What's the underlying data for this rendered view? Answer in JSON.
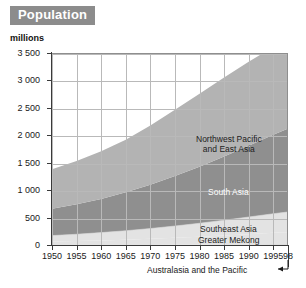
{
  "header": {
    "title": "Population",
    "title_bg": "#8c8c8c",
    "title_color": "#ffffff"
  },
  "chart_data": {
    "type": "area",
    "stacked": true,
    "title": "Population",
    "unit_label": "millions",
    "xlabel": "",
    "ylabel": "millions",
    "grid": true,
    "legend_position": "inline-annotations",
    "xlim": [
      1950,
      1998
    ],
    "ylim": [
      0,
      3500
    ],
    "x": [
      1950,
      1955,
      1960,
      1965,
      1970,
      1975,
      1980,
      1985,
      1990,
      1995,
      1998
    ],
    "x_tick_labels": [
      "1950",
      "1955",
      "1960",
      "1965",
      "1970",
      "1975",
      "1980",
      "1985",
      "1990",
      "1995",
      "98"
    ],
    "y_tick_values": [
      0,
      500,
      1000,
      1500,
      2000,
      2500,
      3000,
      3500
    ],
    "y_tick_labels": [
      "0",
      "500",
      "1 000",
      "1 500",
      "2 000",
      "2 500",
      "3 000",
      "3 500"
    ],
    "series": [
      {
        "name": "Australasia and the Pacific",
        "color": "#cfcfcf",
        "label_placement": "below-axis-annotation",
        "values": [
          12,
          14,
          16,
          18,
          20,
          22,
          24,
          26,
          28,
          30,
          31
        ]
      },
      {
        "name": "Greater Mekong",
        "color": "#e3e3e3",
        "label_placement": "inside-bottom",
        "values": [
          68,
          76,
          86,
          98,
          112,
          128,
          146,
          166,
          188,
          210,
          222
        ]
      },
      {
        "name": "Southeast Asia",
        "color": "#e3e3e3",
        "label_placement": "inside-bottom",
        "values": [
          110,
          124,
          142,
          162,
          186,
          214,
          244,
          278,
          312,
          348,
          368
        ]
      },
      {
        "name": "South Asia",
        "color": "#8f8f8f",
        "label_placement": "inside-middle",
        "values": [
          490,
          545,
          615,
          700,
          800,
          910,
          1030,
          1160,
          1300,
          1440,
          1520
        ]
      },
      {
        "name": "Northwest Pacific and East Asia",
        "color": "#b3b3b3",
        "label_placement": "inside-top",
        "values": [
          720,
          790,
          870,
          960,
          1080,
          1210,
          1330,
          1440,
          1530,
          1600,
          1630
        ]
      }
    ],
    "totals": [
      1400,
      1549,
      1729,
      1938,
      2198,
      2484,
      2774,
      3070,
      3358,
      3628,
      3771
    ],
    "annotations": [
      {
        "text": "Northwest Pacific",
        "line2": "and East Asia",
        "x": 1988,
        "y": 2450
      },
      {
        "text": "South Asia",
        "x": 1990,
        "y": 1050
      },
      {
        "text": "Southeast Asia",
        "x": 1990,
        "y": 330
      },
      {
        "text": "Greater Mekong",
        "x": 1990,
        "y": 170
      },
      {
        "text": "Australasia and the Pacific",
        "x": 1996,
        "y": -350,
        "arrow": "left"
      }
    ]
  }
}
